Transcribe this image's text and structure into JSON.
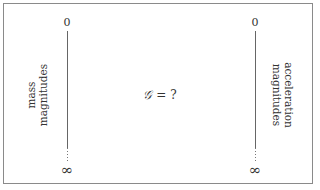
{
  "diagram": {
    "center_formula": {
      "symbol": "𝒢",
      "operator": " = ",
      "value": "?"
    },
    "left_axis": {
      "top_label": "0",
      "bottom_label": "∞",
      "label_lines": [
        "mass",
        "magnitudes"
      ]
    },
    "right_axis": {
      "top_label": "0",
      "bottom_label": "∞",
      "label_lines": [
        "acceleration",
        "magnitudes"
      ]
    }
  }
}
